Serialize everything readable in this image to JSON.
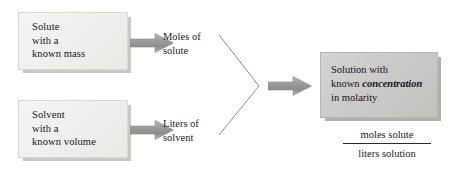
{
  "diagram": {
    "colors": {
      "input_box_fill": "#eeeeec",
      "output_box_fill": "#c9c9c7",
      "arrow_gray": "#9a9a9a",
      "connector_line": "#8e8e8e",
      "text": "#17171a",
      "background": "#ffffff"
    },
    "boxes": [
      {
        "id": "solute",
        "lines": [
          "Solute",
          "with a",
          "known mass"
        ]
      },
      {
        "id": "solvent",
        "lines": [
          "Solvent",
          "with a",
          "known volume"
        ]
      }
    ],
    "mid_labels": [
      {
        "id": "moles",
        "lines": [
          "Moles of",
          "solute"
        ]
      },
      {
        "id": "liters",
        "lines": [
          "Liters of",
          "solvent"
        ]
      }
    ],
    "output_box": {
      "id": "solution",
      "line1": "Solution with",
      "line2_prefix": "known ",
      "line2_emphasis": "concentration",
      "line3": "in molarity"
    },
    "fraction": {
      "numerator": "moles solute",
      "denominator": "liters solution"
    },
    "arrows": [
      {
        "id": "solute-to-moles",
        "label": "arrow"
      },
      {
        "id": "solvent-to-liters",
        "label": "arrow"
      },
      {
        "id": "converge-to-solution",
        "label": "arrow"
      }
    ],
    "connector": {
      "id": "v-connector",
      "label": "converging lines"
    }
  }
}
